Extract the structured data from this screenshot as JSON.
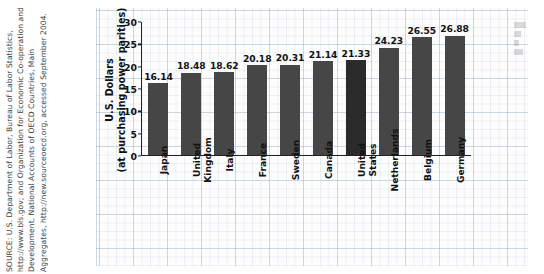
{
  "source_note": {
    "text": "SOURCE: U.S. Department of Labor, Bureau of Labor Statistics, http://www.bls.gov; and Organization for Economic Co-operation and Development, National Accounts of OECD Countries, Main Aggregates, http://new.sourceoecd.org, accessed September 2004."
  },
  "chart_data": {
    "type": "bar",
    "title": "",
    "xlabel": "",
    "ylabel_line1": "U.S. Dollars",
    "ylabel_line2": "(at purchasing power parities)",
    "categories": [
      "Japan",
      "United Kingdom",
      "Italy",
      "France",
      "Sweden",
      "Canada",
      "United States",
      "Netherlands",
      "Belgium",
      "Germany"
    ],
    "category_lines": [
      [
        "Japan"
      ],
      [
        "United",
        "Kingdom"
      ],
      [
        "Italy"
      ],
      [
        "France"
      ],
      [
        "Sweden"
      ],
      [
        "Canada"
      ],
      [
        "United",
        "States"
      ],
      [
        "Netherlands"
      ],
      [
        "Belgium"
      ],
      [
        "Germany"
      ]
    ],
    "values": [
      16.14,
      18.48,
      18.62,
      20.18,
      20.31,
      21.14,
      21.33,
      24.23,
      26.55,
      26.88
    ],
    "value_labels": [
      "16.14",
      "18.48",
      "18.62",
      "20.18",
      "20.31",
      "21.14",
      "21.33",
      "24.23",
      "26.55",
      "26.88"
    ],
    "ylim": [
      0,
      30
    ],
    "yticks": [
      0,
      5,
      10,
      15,
      20,
      25,
      30
    ],
    "ytick_labels": [
      "0",
      "5",
      "10",
      "15",
      "20",
      "25",
      "30"
    ],
    "grid": true,
    "legend": "none",
    "highlight_index": 6,
    "bar_color": "#464646",
    "bar_color_highlight": "#2b2b2b",
    "axis_color": "#222222",
    "grid_color": "#96afc8",
    "background": "#fdfdfd"
  }
}
